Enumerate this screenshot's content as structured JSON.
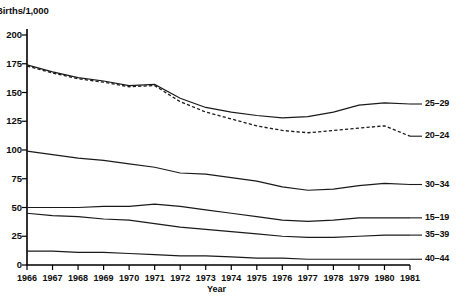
{
  "chart_data": {
    "type": "line",
    "title": "Births/1,000",
    "xlabel": "Year",
    "ylabel": "Births/1,000",
    "grid": false,
    "legend_position": "right-inline",
    "ylim": [
      0,
      200
    ],
    "yticks": [
      0,
      25,
      50,
      75,
      100,
      125,
      150,
      175,
      200
    ],
    "ytick_labels": [
      "0",
      "25",
      "50",
      "75",
      "100",
      "125",
      "150",
      "175",
      "200"
    ],
    "x": [
      1966,
      1967,
      1968,
      1969,
      1970,
      1971,
      1972,
      1973,
      1974,
      1975,
      1976,
      1977,
      1978,
      1979,
      1980,
      1981
    ],
    "xtick_labels": [
      "1966",
      "1967",
      "1968",
      "1969",
      "1970",
      "1971",
      "1972",
      "1973",
      "1974",
      "1975",
      "1976",
      "1977",
      "1978",
      "1979",
      "1980",
      "1981"
    ],
    "series": [
      {
        "name": "25-29",
        "label": "25–29",
        "style": "solid",
        "values": [
          174,
          168,
          163,
          160,
          156,
          157,
          145,
          137,
          133,
          130,
          128,
          129,
          133,
          139,
          141,
          140
        ]
      },
      {
        "name": "20-24",
        "label": "20–24",
        "style": "dashed",
        "values": [
          173,
          167,
          162,
          159,
          155,
          156,
          142,
          133,
          127,
          121,
          117,
          115,
          117,
          119,
          121,
          112
        ]
      },
      {
        "name": "30-34",
        "label": "30–34",
        "style": "solid",
        "values": [
          99,
          96,
          93,
          91,
          88,
          85,
          80,
          79,
          76,
          73,
          68,
          65,
          66,
          69,
          71,
          70
        ]
      },
      {
        "name": "15-19",
        "label": "15–19",
        "style": "solid",
        "values": [
          50,
          50,
          50,
          51,
          51,
          53,
          51,
          48,
          45,
          42,
          39,
          38,
          39,
          41,
          41,
          41
        ]
      },
      {
        "name": "35-39",
        "label": "35–39",
        "style": "solid",
        "values": [
          45,
          43,
          42,
          40,
          39,
          36,
          33,
          31,
          29,
          27,
          25,
          24,
          24,
          25,
          26,
          26
        ]
      },
      {
        "name": "40-44",
        "label": "40–44",
        "style": "solid",
        "values": [
          12,
          12,
          11,
          11,
          10,
          9,
          8,
          8,
          7,
          6,
          6,
          5,
          5,
          5,
          5,
          5
        ]
      }
    ]
  }
}
